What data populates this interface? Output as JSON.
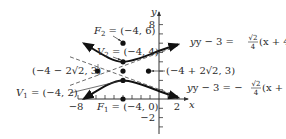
{
  "diagram": {
    "type": "hyperbola-graph",
    "equation_center": [
      -4,
      3
    ],
    "a": 1,
    "b": "2√2",
    "c": 3,
    "axes": {
      "x_label": "x",
      "y_label": "y",
      "x_ticks_labeled": [
        "−8",
        "2"
      ],
      "y_ticks_labeled": [
        "8",
        "−2"
      ],
      "x_range": [
        -9,
        3
      ],
      "y_range": [
        -3.5,
        9
      ]
    },
    "points": {
      "F2": {
        "label_name": "F",
        "label_sub": "2",
        "label_value": " = (−4, 6)",
        "x": -4,
        "y": 6
      },
      "V2": {
        "label_name": "V",
        "label_sub": "2",
        "label_value": " = (−4, 4)",
        "x": -4,
        "y": 4
      },
      "left_point": {
        "label": "(−4 − 2√2, 3)",
        "x": -6.828,
        "y": 3
      },
      "center": {
        "x": -4,
        "y": 3
      },
      "right_point": {
        "label": "(−4 + 2√2, 3)",
        "x": -1.172,
        "y": 3
      },
      "V1": {
        "label_name": "V",
        "label_sub": "1",
        "label_value": " = (−4, 2)",
        "x": -4,
        "y": 2
      },
      "F1": {
        "label_name": "F",
        "label_sub": "1",
        "label_value": " = (−4, 0)",
        "x": -4,
        "y": 0
      }
    },
    "asymptotes": {
      "upper": {
        "lhs": "y − 3 = ",
        "num": "√2",
        "den": "4",
        "rhs": "(x + 4)"
      },
      "lower": {
        "lhs": "y − 3 = −",
        "num": "√2",
        "den": "4",
        "rhs": "(x + 4)"
      }
    },
    "colors": {
      "curve": "#111111",
      "asymptote": "#444444",
      "axis": "#333333",
      "text": "#2a2a2a"
    }
  }
}
